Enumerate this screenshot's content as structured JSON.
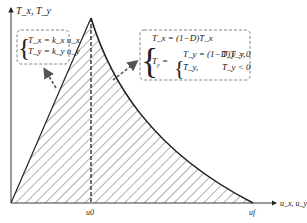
{
  "axes": {
    "y_label": "T_x, T_y",
    "x_label": "u_x, u_y",
    "tick_u0": "u0",
    "tick_uf": "uf"
  },
  "left_equations": {
    "line1": "T_x = k_x u_x",
    "line2": "T_y = k_y u_y"
  },
  "right_equations": {
    "line1": "T_x = (1−D)T̄_x",
    "line2a": "T_y = (1−D)T̄_y,",
    "line2a_cond": "T̄_y > 0",
    "line2b": "T̄_y,",
    "line2b_cond": "T̄_y < 0"
  },
  "colors": {
    "line": "#222222",
    "hatch": "#333333",
    "dash": "#555555"
  }
}
